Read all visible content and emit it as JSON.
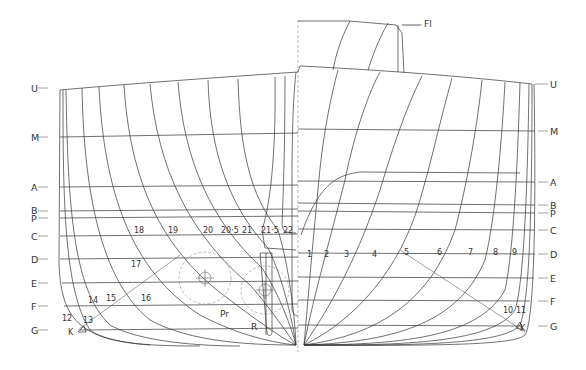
{
  "diagram": {
    "type": "ship body plan (transverse sections)",
    "left_waterlines": [
      {
        "label": "U",
        "y": 88
      },
      {
        "label": "M",
        "y": 137
      },
      {
        "label": "A",
        "y": 187
      },
      {
        "label": "B",
        "y": 211
      },
      {
        "label": "P",
        "y": 218
      },
      {
        "label": "C",
        "y": 236
      },
      {
        "label": "D",
        "y": 259
      },
      {
        "label": "E",
        "y": 283
      },
      {
        "label": "F",
        "y": 306
      },
      {
        "label": "G",
        "y": 330
      }
    ],
    "right_waterlines": [
      {
        "label": "U",
        "y": 84
      },
      {
        "label": "M",
        "y": 131
      },
      {
        "label": "A",
        "y": 182
      },
      {
        "label": "B",
        "y": 205
      },
      {
        "label": "P",
        "y": 213
      },
      {
        "label": "C",
        "y": 230
      },
      {
        "label": "D",
        "y": 254
      },
      {
        "label": "E",
        "y": 278
      },
      {
        "label": "F",
        "y": 301
      },
      {
        "label": "G",
        "y": 326
      }
    ],
    "aft_stations": [
      "12",
      "13",
      "14",
      "15",
      "16",
      "17",
      "18",
      "19",
      "20",
      "20·5",
      "21",
      "21·5",
      "22"
    ],
    "fore_stations": [
      "1",
      "2",
      "3",
      "4",
      "5",
      "6",
      "7",
      "8",
      "9",
      "10",
      "11"
    ],
    "annotations": {
      "forecastle": "Fl",
      "propeller": "Pr",
      "rudder": "R",
      "knuckle_left": "K",
      "knuckle_right": "K"
    }
  }
}
